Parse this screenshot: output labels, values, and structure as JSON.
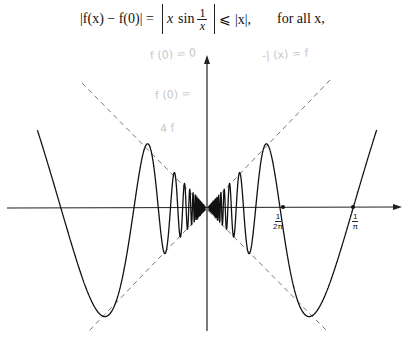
{
  "equation": {
    "lhs": "|f(x) − f(0)| =",
    "x": "x",
    "sin": "sin",
    "frac_num": "1",
    "frac_den": "x",
    "rhs": "⩽ |x|,",
    "qualifier": "for all x,"
  },
  "handwritten_notes": [
    {
      "text": "f (0) = 0"
    },
    {
      "text": "f (0) ="
    },
    {
      "text": "4 f"
    },
    {
      "text": "-| (x) = f"
    }
  ],
  "chart_data": {
    "type": "line",
    "title": "",
    "function": "f(x) = x sin(1/x)",
    "series": [
      {
        "name": "x sin(1/x)",
        "style": "solid"
      },
      {
        "name": "y = x",
        "style": "dashed"
      },
      {
        "name": "y = -x",
        "style": "dashed"
      }
    ],
    "x_tick_labels": [
      {
        "num": "1",
        "den": "2π",
        "x": 0.159
      },
      {
        "num": "1",
        "den": "π",
        "x": 0.318
      }
    ],
    "marked_points": [
      [
        0.159,
        0
      ],
      [
        0.318,
        0
      ]
    ],
    "xlim": [
      -0.43,
      0.42
    ],
    "ylim": [
      -0.25,
      0.32
    ],
    "grid": false,
    "legend": "none"
  }
}
